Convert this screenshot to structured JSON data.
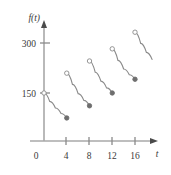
{
  "figure": {
    "name": "piecewise-decay-graph",
    "yaxis_label": "f(t)",
    "xaxis_label": "t",
    "origin_label": "0",
    "y_ticks": [
      {
        "value": 150,
        "label": "150"
      },
      {
        "value": 300,
        "label": "300"
      }
    ],
    "x_ticks": [
      {
        "value": 4,
        "label": "4"
      },
      {
        "value": 8,
        "label": "8"
      },
      {
        "value": 12,
        "label": "12"
      },
      {
        "value": 16,
        "label": "16"
      }
    ],
    "curve_color": "#8a8a8a",
    "axis_color": "#a8a8a8",
    "text_color": "#3a3a3a",
    "open_marker_fill": "#ffffff",
    "closed_marker_fill": "#6e6e6e"
  },
  "chart_data": {
    "type": "line",
    "title": "",
    "xlabel": "t",
    "ylabel": "f(t)",
    "xlim": [
      0,
      20
    ],
    "ylim": [
      0,
      380
    ],
    "grid": false,
    "legend": "none",
    "x_ticks": [
      0,
      4,
      8,
      12,
      16
    ],
    "y_ticks": [
      150,
      300
    ],
    "series": [
      {
        "name": "segment-1",
        "x_start": 0,
        "x_end": 4,
        "y_start": 150,
        "y_end": 72,
        "start_marker": "open",
        "end_marker": "closed",
        "points": [
          {
            "t": 0,
            "f": 150
          },
          {
            "t": 1,
            "f": 124
          },
          {
            "t": 2,
            "f": 103
          },
          {
            "t": 3,
            "f": 86
          },
          {
            "t": 4,
            "f": 72
          }
        ]
      },
      {
        "name": "segment-2",
        "x_start": 4,
        "x_end": 8,
        "y_start": 212,
        "y_end": 110,
        "start_marker": "open",
        "end_marker": "closed",
        "points": [
          {
            "t": 4,
            "f": 212
          },
          {
            "t": 5,
            "f": 177
          },
          {
            "t": 6,
            "f": 148
          },
          {
            "t": 7,
            "f": 127
          },
          {
            "t": 8,
            "f": 110
          }
        ]
      },
      {
        "name": "segment-3",
        "x_start": 8,
        "x_end": 12,
        "y_start": 250,
        "y_end": 150,
        "start_marker": "open",
        "end_marker": "closed",
        "points": [
          {
            "t": 8,
            "f": 250
          },
          {
            "t": 9,
            "f": 215
          },
          {
            "t": 10,
            "f": 187
          },
          {
            "t": 11,
            "f": 166
          },
          {
            "t": 12,
            "f": 150
          }
        ]
      },
      {
        "name": "segment-4",
        "x_start": 12,
        "x_end": 16,
        "y_start": 288,
        "y_end": 193,
        "start_marker": "open",
        "end_marker": "closed",
        "points": [
          {
            "t": 12,
            "f": 288
          },
          {
            "t": 13,
            "f": 252
          },
          {
            "t": 14,
            "f": 225
          },
          {
            "t": 15,
            "f": 207
          },
          {
            "t": 16,
            "f": 193
          }
        ]
      },
      {
        "name": "segment-5",
        "x_start": 16,
        "x_end": 19,
        "y_start": 340,
        "y_end": 255,
        "start_marker": "open",
        "end_marker": "none",
        "points": [
          {
            "t": 16,
            "f": 340
          },
          {
            "t": 17,
            "f": 305
          },
          {
            "t": 18,
            "f": 277
          },
          {
            "t": 19,
            "f": 255
          }
        ]
      }
    ]
  }
}
